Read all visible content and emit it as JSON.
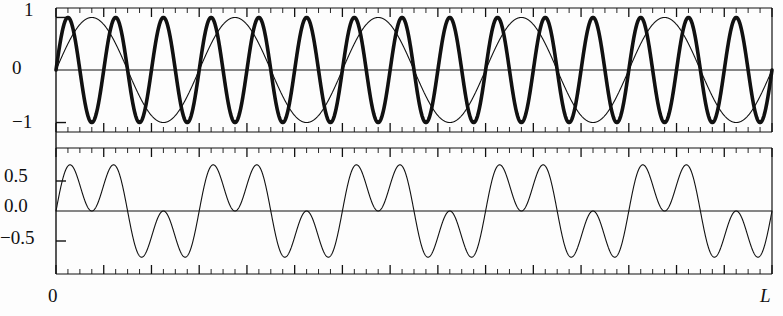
{
  "figure": {
    "width": 783,
    "height": 316,
    "background": "#fdfdfd",
    "frame_color": "#000000",
    "curve_color": "#111111"
  },
  "axis": {
    "x_origin_label": "0",
    "x_end_label": "L",
    "x_range_label": "0 to L",
    "tick_major_count": 15,
    "tick_minor_per_major": 4
  },
  "panels": [
    {
      "name": "top-panel",
      "ylabels": [
        "1",
        "0",
        "−1"
      ],
      "yvalues": [
        1,
        0,
        -1
      ],
      "ylim": [
        -1.18,
        1.18
      ]
    },
    {
      "name": "bottom-panel",
      "ylabels": [
        "0.5",
        "0.0",
        "−0.5"
      ],
      "yvalues": [
        0.5,
        0,
        -0.5
      ],
      "ylim": [
        -1.05,
        1.05
      ]
    }
  ],
  "chart_data": {
    "type": "line",
    "title": "",
    "xlabel": "L",
    "ylabel": "",
    "grid": false,
    "legend": "none",
    "x_range": [
      0,
      1
    ],
    "x_tick_labels": [
      "0",
      "L"
    ],
    "panels": [
      {
        "name": "top-panel",
        "ylim": [
          -1.18,
          1.18
        ],
        "y_tick_values": [
          1,
          0,
          -1
        ],
        "y_tick_labels": [
          "1",
          "0",
          "−1"
        ],
        "series": [
          {
            "name": "fast-sine",
            "kind": "sine",
            "cycles": 15,
            "amplitude": 1,
            "phase": 0,
            "linewidth": "thick",
            "color": "#111111"
          },
          {
            "name": "slow-sine",
            "kind": "sine",
            "cycles": 5,
            "amplitude": 1,
            "phase": 0,
            "linewidth": "thin",
            "color": "#111111"
          }
        ]
      },
      {
        "name": "bottom-panel",
        "ylim": [
          -1.05,
          1.05
        ],
        "y_tick_values": [
          0.5,
          0,
          -0.5
        ],
        "y_tick_labels": [
          "0.5",
          "0.0",
          "−0.5"
        ],
        "series": [
          {
            "name": "superposition",
            "kind": "sum-of-sines",
            "components": [
              {
                "cycles": 15,
                "amplitude": 0.5,
                "phase": 0
              },
              {
                "cycles": 5,
                "amplitude": 0.5,
                "phase": 0
              }
            ],
            "amplitude": 1,
            "linewidth": "thin",
            "color": "#111111"
          }
        ]
      }
    ]
  }
}
